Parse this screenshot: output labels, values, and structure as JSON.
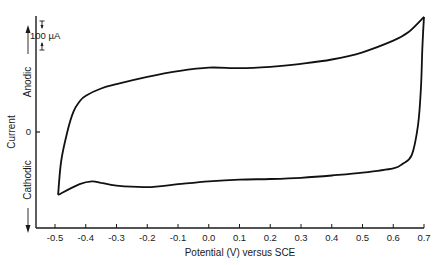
{
  "chart_data": {
    "type": "line",
    "title": "",
    "xlabel": "Potential (V) versus SCE",
    "ylabel": "Current",
    "y_direction_labels": {
      "up": "Anodic",
      "down": "Cathodic"
    },
    "x_ticks": [
      "-0.5",
      "-0.4",
      "-0.3",
      "-0.2",
      "-0.1",
      "0.0",
      "0.1",
      "0.2",
      "0.3",
      "0.4",
      "0.5",
      "0.6",
      "0.7"
    ],
    "y_ticks": [
      "0"
    ],
    "scale_bar": {
      "label": "100 µA",
      "value_uA": 100
    },
    "xlim": [
      -0.55,
      0.7
    ],
    "ylim_uA": [
      -330,
      400
    ],
    "grid": false,
    "legend": null,
    "series": [
      {
        "name": "Anodic sweep (forward)",
        "x": [
          -0.49,
          -0.48,
          -0.46,
          -0.44,
          -0.42,
          -0.4,
          -0.35,
          -0.3,
          -0.2,
          -0.1,
          0.0,
          0.1,
          0.2,
          0.3,
          0.4,
          0.5,
          0.6,
          0.65,
          0.7
        ],
        "y_uA": [
          -217,
          -100,
          0,
          70,
          105,
          125,
          150,
          165,
          190,
          210,
          222,
          220,
          225,
          235,
          250,
          275,
          315,
          345,
          397
        ]
      },
      {
        "name": "Cathodic sweep (reverse)",
        "x": [
          0.7,
          0.695,
          0.69,
          0.68,
          0.66,
          0.63,
          0.6,
          0.5,
          0.4,
          0.3,
          0.2,
          0.1,
          0.0,
          -0.1,
          -0.2,
          -0.3,
          -0.35,
          -0.38,
          -0.42,
          -0.49
        ],
        "y_uA": [
          397,
          300,
          150,
          20,
          -80,
          -110,
          -125,
          -140,
          -150,
          -158,
          -162,
          -164,
          -170,
          -180,
          -190,
          -185,
          -175,
          -170,
          -180,
          -217
        ]
      }
    ]
  }
}
